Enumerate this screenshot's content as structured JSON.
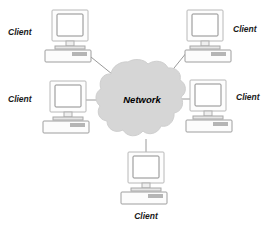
{
  "diagram": {
    "canvas": {
      "width": 274,
      "height": 226,
      "background": "#ffffff"
    },
    "center": {
      "label": "Network",
      "shape": "cloud",
      "fill_color": "#d6d6d6",
      "stroke_color": "#cfcfcf",
      "bounds": {
        "x": 102,
        "y": 61,
        "width": 80,
        "height": 80
      }
    },
    "nodes": [
      {
        "id": "client-top-left",
        "label": "Client",
        "icon": "desktop-computer-icon",
        "label_position": "left",
        "label_x": 8,
        "label_y": 35,
        "computer_x": 47,
        "computer_y": 9
      },
      {
        "id": "client-top-right",
        "label": "Client",
        "icon": "desktop-computer-icon",
        "label_position": "right",
        "label_x": 233,
        "label_y": 32,
        "computer_x": 185,
        "computer_y": 9
      },
      {
        "id": "client-middle-left",
        "label": "Client",
        "icon": "desktop-computer-icon",
        "label_position": "left",
        "label_x": 8,
        "label_y": 102,
        "computer_x": 44,
        "computer_y": 81
      },
      {
        "id": "client-middle-right",
        "label": "Client",
        "icon": "desktop-computer-icon",
        "label_position": "right",
        "label_x": 236,
        "label_y": 100,
        "computer_x": 186,
        "computer_y": 79
      },
      {
        "id": "client-bottom",
        "label": "Client",
        "icon": "desktop-computer-icon",
        "label_position": "below",
        "label_x": 128,
        "label_y": 215,
        "computer_x": 120,
        "computer_y": 150
      }
    ],
    "connections": [
      {
        "from": "client-top-left",
        "to": "network",
        "style": "solid",
        "color": "#9a9a9a"
      },
      {
        "from": "client-top-right",
        "to": "network",
        "style": "solid",
        "color": "#9a9a9a"
      },
      {
        "from": "client-middle-left",
        "to": "network",
        "style": "solid",
        "color": "#9a9a9a"
      },
      {
        "from": "client-middle-right",
        "to": "network",
        "style": "solid",
        "color": "#9a9a9a"
      },
      {
        "from": "client-bottom",
        "to": "network",
        "style": "solid",
        "color": "#9a9a9a"
      }
    ]
  }
}
